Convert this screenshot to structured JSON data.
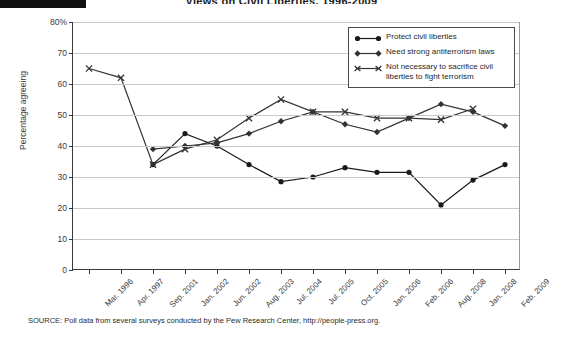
{
  "title": "Views on Civil Liberties, 1996-2009",
  "axes": {
    "ylabel": "Percentage agreeing",
    "yticks": [
      "80%",
      "70",
      "60",
      "50",
      "40",
      "30",
      "20",
      "10",
      "0"
    ],
    "xticks": [
      "Mar. 1996",
      "Apr. 1997",
      "Sep. 2001",
      "Jan. 2002",
      "Jun. 2002",
      "Aug. 2003",
      "Jul. 2004",
      "Jul. 2005",
      "Oct. 2005",
      "Jan. 2006",
      "Feb. 2006",
      "Aug. 2008",
      "Jan. 2008",
      "Feb. 2009"
    ]
  },
  "legend": {
    "items": [
      {
        "label": "Protect civil liberties",
        "marker": "circle",
        "color": "#1a1a1a"
      },
      {
        "label": "Need strong antiterrorism laws",
        "marker": "diamond",
        "color": "#333333"
      },
      {
        "label": "Not necessary to sacrifice civil liberties to fight terrorism",
        "marker": "cross",
        "color": "#333333"
      }
    ]
  },
  "source": "SOURCE: Poll data from several surveys conducted by the Pew Research Center, http://people-press.org.",
  "chart_data": {
    "type": "line",
    "title": "Views on Civil Liberties, 1996-2009",
    "xlabel": "",
    "ylabel": "Percentage agreeing",
    "ylim": [
      0,
      80
    ],
    "grid": true,
    "legend_position": "top-right",
    "categories": [
      "Mar. 1996",
      "Apr. 1997",
      "Sep. 2001",
      "Jan. 2002",
      "Jun. 2002",
      "Aug. 2003",
      "Jul. 2004",
      "Jul. 2005",
      "Oct. 2005",
      "Jan. 2006",
      "Feb. 2006",
      "Aug. 2008",
      "Jan. 2008",
      "Feb. 2009"
    ],
    "series": [
      {
        "name": "Protect civil liberties",
        "marker": "circle",
        "color": "#1a1a1a",
        "values": [
          null,
          null,
          34,
          44,
          40,
          34,
          28.5,
          30,
          33,
          31.5,
          31.5,
          21,
          29,
          34
        ]
      },
      {
        "name": "Need strong antiterrorism laws",
        "marker": "diamond",
        "color": "#333333",
        "values": [
          null,
          null,
          39,
          40,
          41,
          44,
          48,
          51,
          47,
          44.5,
          49,
          53.5,
          51,
          46.5
        ]
      },
      {
        "name": "Not necessary to sacrifice civil liberties to fight terrorism",
        "marker": "cross",
        "color": "#333333",
        "values": [
          65,
          62,
          34,
          39,
          42,
          49,
          55,
          51,
          51,
          49,
          49,
          48.5,
          52,
          null
        ]
      }
    ]
  }
}
